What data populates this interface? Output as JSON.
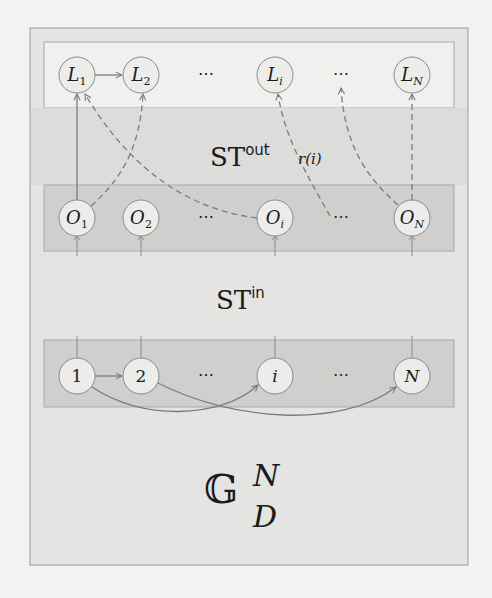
{
  "diagram": {
    "colors": {
      "page_bg": "#f3f3f1",
      "outer_box_fill": "#e4e4e2",
      "outer_box_stroke": "#9a9a98",
      "output_band_fill": "#f0f0ee",
      "middle_band_fill": "#cfcfcd",
      "band_stroke": "#a8a8a6",
      "node_fill": "#ececea",
      "node_stroke": "#8a8a88",
      "edge_color": "#7c7c7a",
      "text_color": "#1a1a1a"
    },
    "labels": {
      "st_out_base": "ST",
      "st_out_sup": "out",
      "r_of_i": "r(i)",
      "st_in_base": "ST",
      "st_in_sup": "in",
      "graph_base": "𝔾",
      "graph_sup": "N",
      "graph_sub": "D"
    },
    "layers": [
      {
        "id": "output",
        "nodes": [
          {
            "id": "L1",
            "base": "L",
            "sub": "1"
          },
          {
            "id": "L2",
            "base": "L",
            "sub": "2"
          },
          {
            "id": "Ldots1",
            "ellipsis": "⋯"
          },
          {
            "id": "Li",
            "base": "L",
            "sub": "i"
          },
          {
            "id": "Ldots2",
            "ellipsis": "⋯"
          },
          {
            "id": "LN",
            "base": "L",
            "sub": "N"
          }
        ]
      },
      {
        "id": "ordering",
        "nodes": [
          {
            "id": "O1",
            "base": "O",
            "sub": "1"
          },
          {
            "id": "O2",
            "base": "O",
            "sub": "2"
          },
          {
            "id": "Odots1",
            "ellipsis": "⋯"
          },
          {
            "id": "Oi",
            "base": "O",
            "sub": "i"
          },
          {
            "id": "Odots2",
            "ellipsis": "⋯"
          },
          {
            "id": "ON",
            "base": "O",
            "sub": "N"
          }
        ]
      },
      {
        "id": "input",
        "nodes": [
          {
            "id": "n1",
            "text": "1"
          },
          {
            "id": "n2",
            "text": "2"
          },
          {
            "id": "ndots1",
            "ellipsis": "⋯"
          },
          {
            "id": "ni",
            "text": "i",
            "italic": true
          },
          {
            "id": "ndots2",
            "ellipsis": "⋯"
          },
          {
            "id": "nN",
            "text": "N",
            "italic": true
          }
        ]
      }
    ],
    "edges": [
      {
        "from": "L1",
        "to": "L2",
        "style": "solid",
        "label": "L1 to L2"
      },
      {
        "from": "O1",
        "to": "L1",
        "style": "solid",
        "label": "O1 to L1"
      },
      {
        "from": "O1",
        "to": "L2",
        "style": "dashed",
        "label": "O1 to L2"
      },
      {
        "from": "Oi",
        "to": "L1",
        "style": "dashed",
        "label": "Oi to L1"
      },
      {
        "from": "Odots2",
        "to": "Li",
        "style": "dashed",
        "label": "O-dots to Li"
      },
      {
        "from": "ON",
        "to": "Ldots2",
        "style": "dashed",
        "label": "ON to L-dots"
      },
      {
        "from": "ON",
        "to": "LN",
        "style": "dashed",
        "label": "ON to LN"
      },
      {
        "from": "n1",
        "to": "n2",
        "style": "solid",
        "label": "1 to 2"
      },
      {
        "from": "n1",
        "to": "ni",
        "style": "solid",
        "label": "1 to i"
      },
      {
        "from": "n2",
        "to": "nN",
        "style": "solid",
        "label": "2 to N"
      }
    ]
  }
}
